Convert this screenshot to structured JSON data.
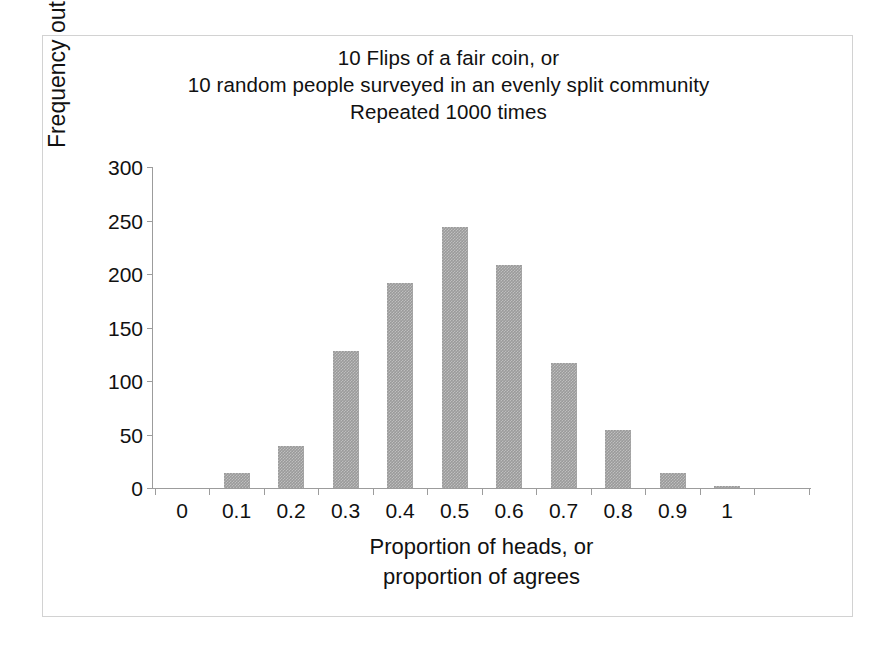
{
  "chart_data": {
    "type": "bar",
    "title": "10 Flips of a fair coin, or\n10 random people surveyed in an evenly split community\nRepeated 1000 times",
    "title_lines": [
      "10 Flips of a fair coin, or",
      "10 random people surveyed in an evenly split community",
      "Repeated 1000 times"
    ],
    "xlabel": "Proportion of heads, or proportion of agrees",
    "xlabel_lines": [
      "Proportion of heads, or",
      "proportion of agrees"
    ],
    "ylabel": "Frequency out of 1000",
    "categories": [
      "0",
      "0.1",
      "0.2",
      "0.3",
      "0.4",
      "0.5",
      "0.6",
      "0.7",
      "0.8",
      "0.9",
      "1"
    ],
    "values": [
      0,
      14,
      39,
      128,
      192,
      244,
      208,
      117,
      54,
      14,
      2
    ],
    "xtick_labels": [
      "0",
      "0.1",
      "0.2",
      "0.3",
      "0.4",
      "0.5",
      "0.6",
      "0.7",
      "0.8",
      "0.9",
      "1"
    ],
    "ytick_labels": [
      "0",
      "50",
      "100",
      "150",
      "200",
      "250",
      "300"
    ],
    "ytick_values": [
      0,
      50,
      100,
      150,
      200,
      250,
      300
    ],
    "ylim": [
      0,
      300
    ],
    "grid": false,
    "legend": false,
    "legend_position": "none",
    "bar_color": "#9a9a9a",
    "axis_color": "#9c9c9c",
    "frame_color": "#d2d2d2",
    "background_color": "#ffffff"
  }
}
